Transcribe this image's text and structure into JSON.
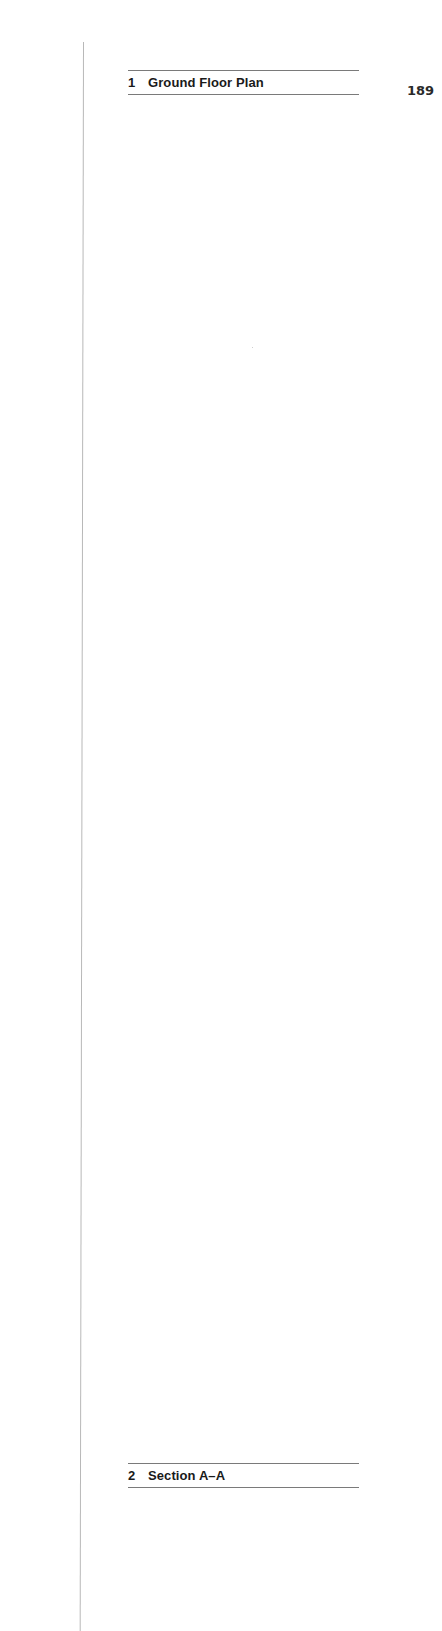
{
  "page": {
    "number": "189"
  },
  "figures": [
    {
      "number": "1",
      "title": "Ground Floor Plan"
    },
    {
      "number": "2",
      "title": "Section A–A"
    }
  ],
  "colors": {
    "rule": "#7a7a7a",
    "gutter": "#b8b8b8",
    "text": "#1a1a1a"
  }
}
